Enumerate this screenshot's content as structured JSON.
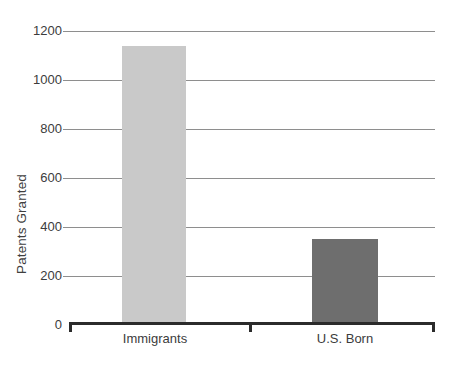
{
  "chart_data": {
    "type": "bar",
    "title": "",
    "subtitle": "",
    "xlabel": "",
    "ylabel": "Patents Granted",
    "categories": [
      "Immigrants",
      "U.S. Born"
    ],
    "values": [
      1140,
      350
    ],
    "series": [
      {
        "name": "Patents Granted",
        "values": [
          1140,
          350
        ]
      }
    ],
    "ylim": [
      0,
      1200
    ],
    "yticks": [
      0,
      200,
      400,
      600,
      800,
      1000,
      1200
    ],
    "ytick_labels": [
      "0",
      "200",
      "400",
      "600",
      "800",
      "1000",
      "1200"
    ],
    "grid": true,
    "grid_axis": "y",
    "legend": false,
    "legend_position": "none",
    "annotations": [],
    "bar_colors": [
      "#c9c9c9",
      "#6e6e6e"
    ],
    "colors": {
      "bar_immigrants": "#c9c9c9",
      "bar_us_born": "#6e6e6e",
      "gridline": "#8e8e8e",
      "axis": "#2b2b2b",
      "text": "#3c3c3c",
      "background": "#ffffff"
    }
  },
  "axis": {
    "y_title": "Patents Granted",
    "ticks": [
      {
        "label": "1200",
        "value": 1200
      },
      {
        "label": "1000",
        "value": 1000
      },
      {
        "label": "800",
        "value": 800
      },
      {
        "label": "600",
        "value": 600
      },
      {
        "label": "400",
        "value": 400
      },
      {
        "label": "200",
        "value": 200
      },
      {
        "label": "0",
        "value": 0
      }
    ]
  },
  "bars": [
    {
      "label": "Immigrants",
      "value": 1140,
      "color": "#c9c9c9"
    },
    {
      "label": "U.S. Born",
      "value": 350,
      "color": "#6e6e6e"
    }
  ]
}
